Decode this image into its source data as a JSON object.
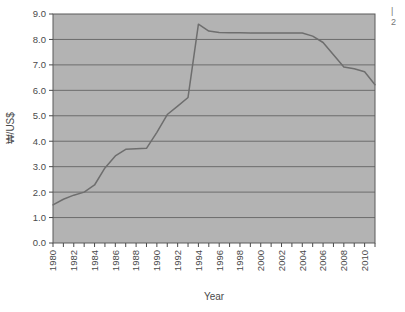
{
  "chart_data": {
    "type": "line",
    "title": "",
    "xlabel": "Year",
    "ylabel": "₩/US$",
    "xlim": [
      1980,
      2011
    ],
    "ylim": [
      0.0,
      9.0
    ],
    "ytick_step": 1.0,
    "xtick_step": 1,
    "xtick_label_step": 2,
    "grid": "horizontal",
    "legend": "none",
    "plot_background": "#b3b3b3",
    "line_color": "#6e6e6e",
    "ytick_labels": [
      "0.0",
      "1.0",
      "2.0",
      "3.0",
      "4.0",
      "5.0",
      "6.0",
      "7.0",
      "8.0",
      "9.0"
    ],
    "xtick_labels": [
      "1980",
      "1982",
      "1984",
      "1986",
      "1988",
      "1990",
      "1992",
      "1994",
      "1996",
      "1998",
      "2000",
      "2002",
      "2004",
      "2006",
      "2008",
      "2010"
    ],
    "x": [
      1980,
      1981,
      1982,
      1983,
      1984,
      1985,
      1986,
      1987,
      1988,
      1989,
      1990,
      1991,
      1992,
      1993,
      1994,
      1995,
      1996,
      1997,
      1998,
      1999,
      2000,
      2001,
      2002,
      2003,
      2004,
      2005,
      2006,
      2007,
      2008,
      2009,
      2010,
      2011
    ],
    "values": [
      1.5,
      1.72,
      1.88,
      2.0,
      2.28,
      2.95,
      3.42,
      3.68,
      3.7,
      3.72,
      4.35,
      5.05,
      5.38,
      5.72,
      8.6,
      8.33,
      8.27,
      8.26,
      8.26,
      8.25,
      8.25,
      8.25,
      8.25,
      8.25,
      8.25,
      8.13,
      7.88,
      7.4,
      6.92,
      6.85,
      6.73,
      6.22
    ],
    "series_name": "₩/US$"
  },
  "axes": {
    "y_axis_title": "₩/US$",
    "x_axis_title": "Year"
  },
  "edge_text": {
    "fragment_top": "|",
    "fragment_bottom": "2"
  }
}
